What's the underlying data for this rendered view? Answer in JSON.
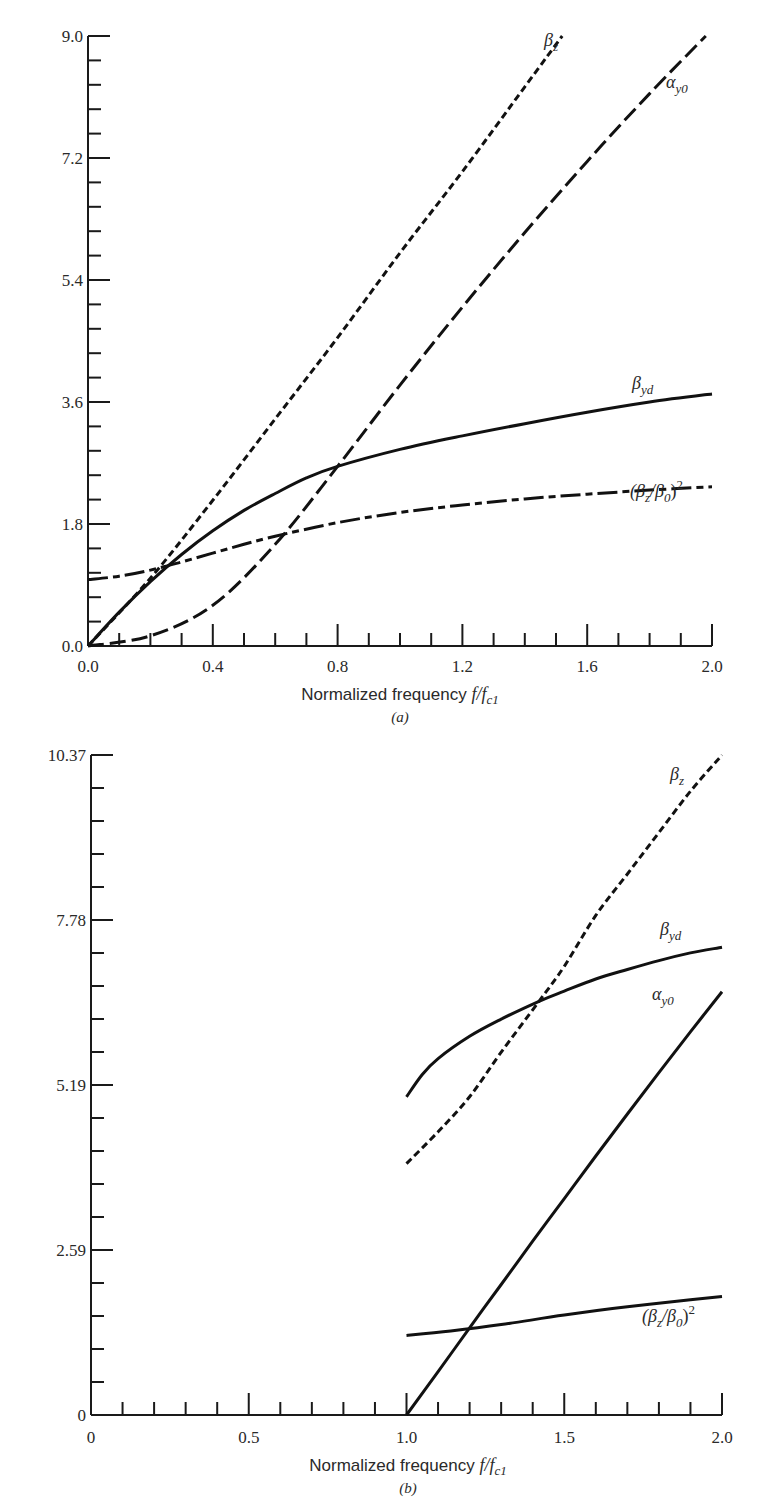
{
  "chart_data": [
    {
      "id": "a",
      "type": "line",
      "caption": "(a)",
      "title": "",
      "xlabel": "Normalized frequency f/f_c1",
      "xlabel_parts": {
        "prefix": "Normalized frequency ",
        "math": "f/f",
        "sub": "c1"
      },
      "ylabel": "",
      "xlim": [
        0.0,
        2.0
      ],
      "ylim": [
        0.0,
        9.0
      ],
      "x_ticks": [
        "0.0",
        "0.4",
        "0.8",
        "1.2",
        "1.6",
        "2.0"
      ],
      "y_ticks": [
        "0.0",
        "1.8",
        "3.6",
        "5.4",
        "7.2",
        "9.0"
      ],
      "x_minor_step": 0.1,
      "y_minor_step": 0.36,
      "grid": false,
      "legend": "inline labels",
      "series": [
        {
          "name": "β_z",
          "label_main": "β",
          "label_sub": "z",
          "style": "short-dash",
          "x": [
            0.0,
            0.2,
            0.4,
            0.6,
            0.8,
            1.0,
            1.2,
            1.4,
            1.52
          ],
          "y": [
            0.0,
            1.0,
            2.15,
            3.35,
            4.55,
            5.8,
            7.0,
            8.25,
            9.0
          ]
        },
        {
          "name": "α_y0",
          "label_main": "α",
          "label_sub": "y0",
          "style": "long-dash",
          "x": [
            0.0,
            0.2,
            0.4,
            0.6,
            0.8,
            1.0,
            1.2,
            1.4,
            1.6,
            1.8,
            1.98
          ],
          "y": [
            0.0,
            0.15,
            0.6,
            1.5,
            2.65,
            3.85,
            5.0,
            6.1,
            7.15,
            8.15,
            9.0
          ]
        },
        {
          "name": "β_yd",
          "label_main": "β",
          "label_sub": "yd",
          "style": "solid",
          "x": [
            0.0,
            0.1,
            0.2,
            0.3,
            0.4,
            0.5,
            0.6,
            0.7,
            0.8,
            1.0,
            1.2,
            1.4,
            1.6,
            1.8,
            2.0
          ],
          "y": [
            0.0,
            0.5,
            0.95,
            1.35,
            1.7,
            2.0,
            2.25,
            2.48,
            2.65,
            2.9,
            3.1,
            3.28,
            3.45,
            3.6,
            3.72
          ]
        },
        {
          "name": "(β_z/β_0)^2",
          "label_main": "(β",
          "label_sub": "z",
          "label_mid": "/β",
          "label_sub2": "0",
          "label_end": ")",
          "label_sup": "2",
          "style": "dash-dot",
          "x": [
            0.0,
            0.1,
            0.2,
            0.3,
            0.4,
            0.5,
            0.6,
            0.8,
            1.0,
            1.2,
            1.4,
            1.6,
            1.8,
            2.0
          ],
          "y": [
            0.98,
            1.03,
            1.12,
            1.24,
            1.37,
            1.5,
            1.62,
            1.82,
            1.97,
            2.08,
            2.17,
            2.24,
            2.3,
            2.35
          ]
        }
      ]
    },
    {
      "id": "b",
      "type": "line",
      "caption": "(b)",
      "title": "",
      "xlabel": "Normalized frequency f/f_c1",
      "xlabel_parts": {
        "prefix": "Normalized frequency ",
        "math": "f/f",
        "sub": "c1"
      },
      "ylabel": "",
      "xlim": [
        0.0,
        2.0
      ],
      "ylim": [
        0.0,
        10.37
      ],
      "x_ticks": [
        "0",
        "0.5",
        "1.0",
        "1.5",
        "2.0"
      ],
      "y_ticks": [
        "0",
        "2.59",
        "5.19",
        "7.78",
        "10.37"
      ],
      "x_minor_step": 0.1,
      "y_minor_step": 0.518,
      "grid": false,
      "legend": "inline labels",
      "series": [
        {
          "name": "β_z",
          "label_main": "β",
          "label_sub": "z",
          "style": "short-dash",
          "x": [
            1.0,
            1.1,
            1.2,
            1.3,
            1.42,
            1.5,
            1.6,
            1.7,
            1.8,
            1.9,
            2.0
          ],
          "y": [
            3.95,
            4.45,
            5.0,
            5.7,
            6.5,
            7.05,
            7.85,
            8.5,
            9.15,
            9.8,
            10.37
          ]
        },
        {
          "name": "β_yd",
          "label_main": "β",
          "label_sub": "yd",
          "style": "solid",
          "x": [
            1.0,
            1.05,
            1.1,
            1.2,
            1.3,
            1.42,
            1.5,
            1.6,
            1.7,
            1.8,
            1.9,
            2.0
          ],
          "y": [
            5.0,
            5.35,
            5.6,
            5.95,
            6.22,
            6.5,
            6.66,
            6.85,
            7.0,
            7.14,
            7.26,
            7.35
          ]
        },
        {
          "name": "α_y0",
          "label_main": "α",
          "label_sub": "y0",
          "style": "solid",
          "x": [
            1.0,
            1.1,
            1.2,
            1.3,
            1.4,
            1.5,
            1.6,
            1.7,
            1.8,
            1.9,
            2.0
          ],
          "y": [
            0.0,
            0.68,
            1.37,
            2.05,
            2.73,
            3.4,
            4.07,
            4.73,
            5.38,
            6.02,
            6.65
          ]
        },
        {
          "name": "(β_z/β_0)^2",
          "label_main": "(β",
          "label_sub": "z",
          "label_mid": "/β",
          "label_sub2": "0",
          "label_end": ")",
          "label_sup": "2",
          "style": "solid",
          "x": [
            1.0,
            1.14,
            1.3,
            1.5,
            1.7,
            1.9,
            2.0
          ],
          "y": [
            1.25,
            1.32,
            1.42,
            1.57,
            1.7,
            1.81,
            1.86
          ]
        }
      ]
    }
  ]
}
